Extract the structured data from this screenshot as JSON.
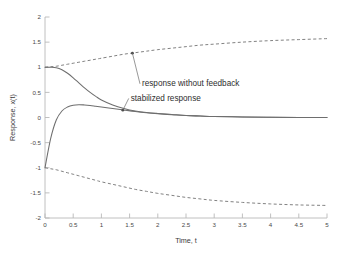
{
  "chart_data": {
    "type": "line",
    "title": "",
    "xlabel": "Time, t",
    "ylabel": "Response, x(t)",
    "xlim": [
      0,
      5
    ],
    "ylim": [
      -2,
      2
    ],
    "xticks": [
      0,
      0.5,
      1,
      1.5,
      2,
      2.5,
      3,
      3.5,
      4,
      4.5,
      5
    ],
    "xticklabels": [
      "0",
      "0.5",
      "1",
      "1.5",
      "2",
      "2.5",
      "3",
      "3.5",
      "4",
      "4.5",
      "5"
    ],
    "yticks": [
      -2,
      -1.5,
      -1,
      -0.5,
      0,
      0.5,
      1,
      1.5,
      2
    ],
    "yticklabels": [
      "-2",
      "-1.5",
      "-1",
      "-0.5",
      "0",
      "0.5",
      "1",
      "1.5",
      "2"
    ],
    "grid": false,
    "legend": "none",
    "x": [
      0,
      0.1,
      0.2,
      0.3,
      0.4,
      0.5,
      0.6,
      0.7,
      0.8,
      0.9,
      1.0,
      1.2,
      1.4,
      1.6,
      1.8,
      2.0,
      2.25,
      2.5,
      2.75,
      3.0,
      3.5,
      4.0,
      4.5,
      5.0
    ],
    "series": [
      {
        "name": "unstable-upper",
        "style": "dashed",
        "color": "#7a7a7a",
        "values": [
          1.0,
          1.01,
          1.02,
          1.04,
          1.06,
          1.08,
          1.1,
          1.12,
          1.14,
          1.16,
          1.18,
          1.22,
          1.26,
          1.29,
          1.32,
          1.35,
          1.38,
          1.41,
          1.44,
          1.46,
          1.5,
          1.53,
          1.55,
          1.57
        ]
      },
      {
        "name": "unstable-lower",
        "style": "dashed",
        "color": "#7a7a7a",
        "values": [
          -1.0,
          -1.02,
          -1.04,
          -1.07,
          -1.1,
          -1.13,
          -1.16,
          -1.19,
          -1.22,
          -1.25,
          -1.28,
          -1.33,
          -1.38,
          -1.43,
          -1.47,
          -1.51,
          -1.55,
          -1.59,
          -1.62,
          -1.65,
          -1.69,
          -1.72,
          -1.74,
          -1.75
        ]
      },
      {
        "name": "stabilized-from-positive-one",
        "style": "solid",
        "color": "#6e6e6e",
        "values": [
          1.0,
          1.0,
          0.99,
          0.95,
          0.88,
          0.79,
          0.69,
          0.59,
          0.5,
          0.42,
          0.35,
          0.25,
          0.18,
          0.13,
          0.1,
          0.08,
          0.06,
          0.04,
          0.03,
          0.02,
          0.01,
          0.005,
          0.002,
          0.0
        ]
      },
      {
        "name": "stabilized-from-negative-one",
        "style": "solid",
        "color": "#6e6e6e",
        "values": [
          -1.0,
          -0.42,
          -0.05,
          0.13,
          0.21,
          0.245,
          0.255,
          0.25,
          0.24,
          0.225,
          0.21,
          0.18,
          0.15,
          0.12,
          0.095,
          0.075,
          0.055,
          0.04,
          0.03,
          0.02,
          0.01,
          0.005,
          0.002,
          0.0
        ]
      }
    ],
    "annotations": [
      {
        "text": "response without feedback",
        "text_x": 1.72,
        "text_y": 0.62,
        "point_x": 1.55,
        "point_y": 1.28
      },
      {
        "text": "stabilized response",
        "text_x": 1.52,
        "text_y": 0.33,
        "point_x": 1.38,
        "point_y": 0.145
      }
    ]
  }
}
